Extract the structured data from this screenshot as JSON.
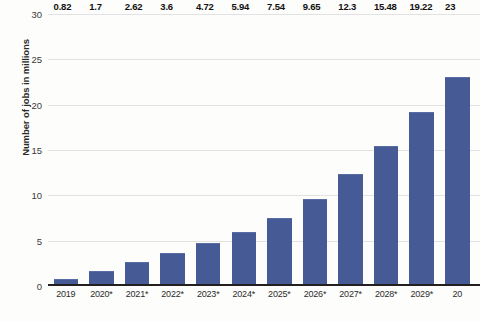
{
  "chart_data": {
    "type": "bar",
    "title": "",
    "subtitle": "",
    "xlabel": "",
    "ylabel": "Number of jobs in millions",
    "categories": [
      "2019",
      "2020*",
      "2021*",
      "2022*",
      "2023*",
      "2024*",
      "2025*",
      "2026*",
      "2027*",
      "2028*",
      "2029*",
      "20"
    ],
    "values": [
      0.82,
      1.7,
      2.62,
      3.6,
      4.72,
      5.94,
      7.54,
      9.65,
      12.3,
      15.48,
      19.22,
      23
    ],
    "value_labels": [
      "0.82",
      "1.7",
      "2.62",
      "3.6",
      "4.72",
      "5.94",
      "7.54",
      "9.65",
      "12.3",
      "15.48",
      "19.22",
      "23"
    ],
    "ylim": [
      0,
      30
    ],
    "yticks": [
      0,
      5,
      10,
      15,
      20,
      25,
      30
    ],
    "ytick_labels": [
      "0",
      "5",
      "10",
      "15",
      "20",
      "25",
      "30"
    ],
    "grid": true,
    "legend": "none",
    "bar_color": "#465a96",
    "grid_color": "#e2e2e2",
    "axis_color": "#231f20",
    "background_color": "#fdfdfb",
    "note": "Last category label is clipped at the right edge of the image, rendering as '20'."
  }
}
